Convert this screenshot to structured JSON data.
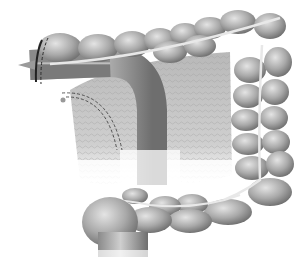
{
  "image": {
    "subject": "colon-anatomy-illustration",
    "style": "grayscale medical illustration",
    "colors": {
      "background": "#ffffff",
      "lobe_light": "#d8d8d8",
      "lobe_mid": "#a8a8a8",
      "lobe_dark": "#6e6e6e",
      "taenia": "#e6e6e6",
      "mesentery": "#c4c4c4",
      "staple_line": "#2a2a2a"
    },
    "regions": [
      {
        "name": "transverse-colon"
      },
      {
        "name": "descending-colon"
      },
      {
        "name": "sigmoid-colon"
      },
      {
        "name": "rectum-stump"
      },
      {
        "name": "mesentery"
      },
      {
        "name": "bowel-tube"
      },
      {
        "name": "stapled-end"
      }
    ]
  }
}
